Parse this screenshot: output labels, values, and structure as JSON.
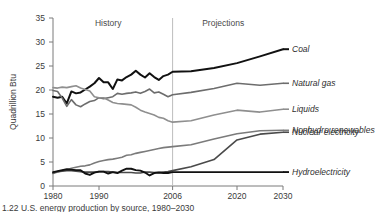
{
  "figure": {
    "ylabel": "Quadrillion Btu",
    "history_label": "History",
    "projections_label": "Projections",
    "caption": "1.22  U.S. energy production by source, 1980–2030"
  },
  "chart_data": {
    "type": "line",
    "title": "",
    "xlabel": "",
    "ylabel": "Quadrillion Btu",
    "xlim": [
      1980,
      2030
    ],
    "ylim": [
      0,
      35
    ],
    "yticks": [
      0,
      5,
      10,
      15,
      20,
      25,
      30,
      35
    ],
    "xticks": [
      1980,
      1990,
      2006,
      2020,
      2030
    ],
    "xtick_labels": [
      "1980",
      "1990",
      "2006",
      "2020",
      "2030"
    ],
    "grid": false,
    "legend_position": "right-inline",
    "annotations": [
      {
        "text": "History",
        "x": 1992,
        "y": 34
      },
      {
        "text": "Projections",
        "x": 2017,
        "y": 34
      }
    ],
    "divider_x": 2006,
    "x": [
      1980,
      1981,
      1982,
      1983,
      1984,
      1985,
      1986,
      1987,
      1988,
      1989,
      1990,
      1991,
      1992,
      1993,
      1994,
      1995,
      1996,
      1997,
      1998,
      1999,
      2000,
      2001,
      2002,
      2003,
      2004,
      2005,
      2006,
      2010,
      2015,
      2020,
      2025,
      2030
    ],
    "series": [
      {
        "name": "Coal",
        "color": "#111111",
        "width": 2.0,
        "values": [
          18.6,
          18.4,
          18.6,
          17.2,
          19.7,
          19.3,
          19.5,
          20.1,
          20.7,
          21.4,
          22.5,
          21.6,
          21.6,
          20.2,
          22.2,
          22.0,
          22.7,
          23.2,
          24.0,
          23.2,
          22.6,
          23.5,
          22.7,
          22.1,
          22.9,
          23.2,
          23.8,
          23.9,
          24.6,
          25.6,
          27.0,
          28.5
        ]
      },
      {
        "name": "Natural gas",
        "color": "#6d6d6d",
        "width": 1.6,
        "values": [
          19.9,
          19.7,
          18.3,
          16.6,
          18.0,
          16.9,
          16.5,
          17.1,
          17.6,
          17.8,
          18.4,
          18.2,
          18.4,
          18.6,
          19.3,
          19.1,
          19.3,
          19.4,
          19.6,
          19.3,
          19.7,
          20.2,
          19.4,
          19.6,
          19.1,
          18.6,
          19.0,
          19.5,
          20.3,
          21.4,
          21.0,
          21.4
        ]
      },
      {
        "name": "Liquids",
        "color": "#8f8f8f",
        "width": 1.6,
        "values": [
          20.5,
          20.4,
          20.6,
          20.5,
          20.7,
          20.9,
          20.4,
          20.1,
          19.8,
          18.6,
          18.4,
          18.4,
          17.9,
          17.4,
          17.2,
          17.1,
          17.0,
          16.9,
          16.4,
          15.8,
          15.4,
          15.1,
          14.8,
          14.3,
          14.1,
          13.6,
          13.3,
          13.6,
          14.8,
          15.8,
          15.4,
          16.0
        ]
      },
      {
        "name": "Nonhydro renewables",
        "color": "#7b7b7b",
        "width": 1.6,
        "values": [
          2.6,
          2.9,
          3.2,
          3.4,
          3.7,
          3.9,
          4.1,
          4.2,
          4.4,
          4.8,
          5.1,
          5.3,
          5.5,
          5.6,
          5.8,
          6.0,
          6.4,
          6.5,
          6.8,
          7.0,
          7.2,
          7.4,
          7.6,
          7.8,
          8.0,
          8.1,
          8.2,
          8.6,
          9.8,
          10.9,
          11.5,
          11.6
        ]
      },
      {
        "name": "Nuclear electricity",
        "color": "#4a4a4a",
        "width": 1.6,
        "values": [
          2.7,
          3.0,
          3.1,
          3.2,
          3.2,
          3.1,
          3.0,
          2.9,
          2.9,
          2.9,
          3.0,
          3.0,
          3.0,
          2.9,
          2.8,
          2.8,
          2.8,
          2.8,
          2.7,
          2.7,
          2.9,
          2.9,
          2.8,
          2.8,
          2.9,
          3.0,
          3.2,
          4.0,
          5.5,
          9.6,
          10.8,
          11.2
        ]
      },
      {
        "name": "Hydroelectricity",
        "color": "#111111",
        "width": 1.9,
        "values": [
          2.9,
          3.1,
          3.3,
          3.5,
          3.4,
          3.3,
          3.3,
          2.6,
          2.3,
          2.8,
          3.0,
          3.0,
          2.6,
          2.9,
          2.7,
          3.2,
          3.6,
          3.6,
          3.3,
          3.2,
          2.8,
          2.2,
          2.7,
          2.8,
          2.7,
          2.7,
          2.9,
          2.9,
          2.9,
          2.9,
          2.9,
          2.9
        ]
      }
    ],
    "series_labels": [
      {
        "name": "Coal",
        "label_y": 25.0
      },
      {
        "name": "Natural gas",
        "label_y": 18.5
      },
      {
        "name": "Liquids",
        "label_y": 13.4
      },
      {
        "name": "Nonhydro renewables",
        "label_y": 10.6
      },
      {
        "name": "Nuclear electricity",
        "label_y": 9.3
      },
      {
        "name": "Hydroelectricity",
        "label_y": 2.6
      }
    ]
  }
}
